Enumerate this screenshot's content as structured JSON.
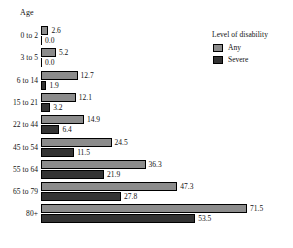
{
  "chart": {
    "type": "bar",
    "orientation": "horizontal",
    "axis_group_title": "Age",
    "title": "",
    "xlabel": "",
    "ylabel": "Age"
  },
  "legend": {
    "title": "Level of disability",
    "position": "top-right",
    "items": [
      {
        "label": "Any",
        "color": "#8c8c8c",
        "swatch_name": "legend-swatch-any"
      },
      {
        "label": "Severe",
        "color": "#333333",
        "swatch_name": "legend-swatch-severe"
      }
    ]
  },
  "chart_data": {
    "type": "bar",
    "orientation": "horizontal",
    "title": "",
    "xlabel": "",
    "ylabel": "Age",
    "grid": false,
    "legend_position": "top-right",
    "legend_title": "Level of disability",
    "categories": [
      "0 to 2",
      "3 to 5",
      "6 to 14",
      "15 to 21",
      "22 to 44",
      "45 to 54",
      "55 to 64",
      "65 to 79",
      "80+"
    ],
    "series": [
      {
        "name": "Any",
        "color": "#8c8c8c",
        "values": [
          2.6,
          5.2,
          12.7,
          12.1,
          14.9,
          24.5,
          36.3,
          47.3,
          71.5
        ],
        "labels": [
          "2.6",
          "5.2",
          "12.7",
          "12.1",
          "14.9",
          "24.5",
          "36.3",
          "47.3",
          "71.5"
        ]
      },
      {
        "name": "Severe",
        "color": "#333333",
        "values": [
          0.0,
          0.0,
          1.9,
          3.2,
          6.4,
          11.5,
          21.9,
          27.8,
          53.5
        ],
        "labels": [
          "0.0",
          "0.0",
          "1.9",
          "3.2",
          "6.4",
          "11.5",
          "21.9",
          "27.8",
          "53.5"
        ]
      }
    ],
    "xlim": [
      0,
      71.5
    ],
    "value_labels_shown": true
  }
}
